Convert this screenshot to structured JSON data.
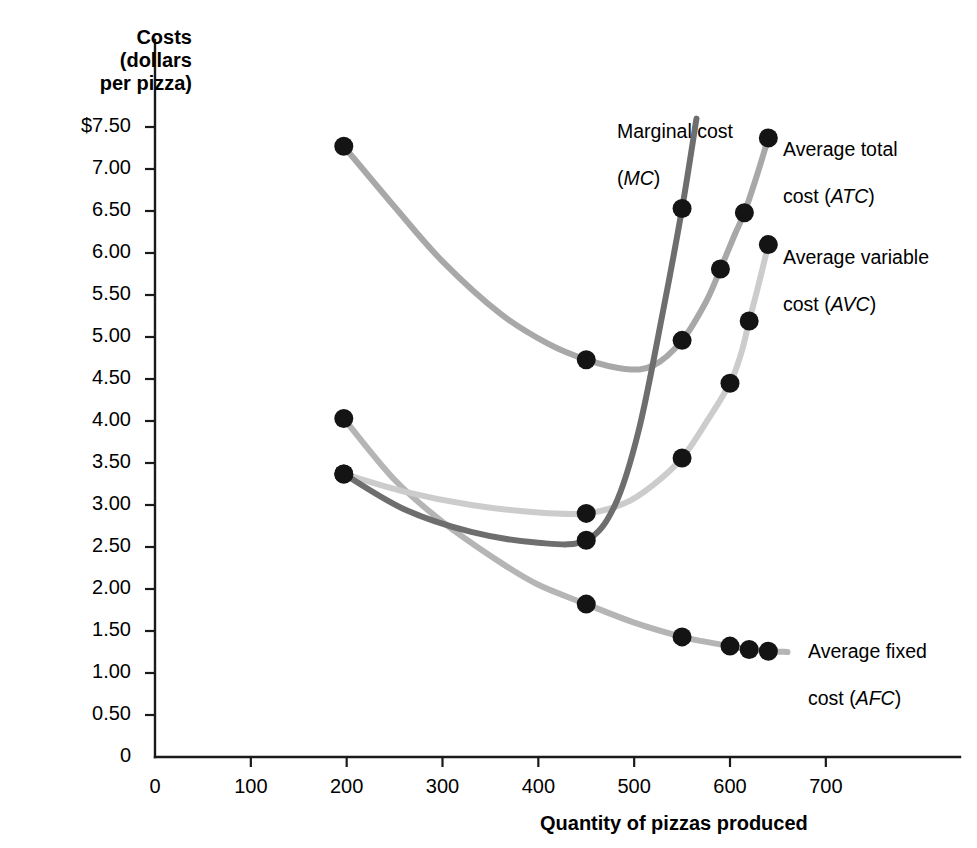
{
  "chart_data": {
    "type": "line",
    "title": "",
    "xlabel": "Quantity of pizzas produced",
    "ylabel": "Costs (dollars per pizza)",
    "xlim": [
      0,
      700
    ],
    "ylim": [
      0,
      7.75
    ],
    "grid": false,
    "legend_position": "inline-annotations",
    "x_ticks": [
      "0",
      "100",
      "200",
      "300",
      "400",
      "500",
      "600",
      "700"
    ],
    "x_tick_values": [
      0,
      100,
      200,
      300,
      400,
      500,
      600,
      700
    ],
    "y_ticks": [
      "0",
      "0.50",
      "1.00",
      "1.50",
      "2.00",
      "2.50",
      "3.00",
      "3.50",
      "4.00",
      "4.50",
      "5.00",
      "5.50",
      "6.00",
      "6.50",
      "7.00",
      "$7.50"
    ],
    "y_tick_values": [
      0,
      0.5,
      1.0,
      1.5,
      2.0,
      2.5,
      3.0,
      3.5,
      4.0,
      4.5,
      5.0,
      5.5,
      6.0,
      6.5,
      7.0,
      7.5
    ],
    "series": [
      {
        "name": "Marginal cost (MC)",
        "short": "MC",
        "color": "#6e6e6e",
        "points": [
          {
            "x": 197,
            "y": 3.37
          },
          {
            "x": 450,
            "y": 2.58
          },
          {
            "x": 550,
            "y": 6.53
          }
        ]
      },
      {
        "name": "Average total cost (ATC)",
        "short": "ATC",
        "color": "#a8a8a8",
        "points": [
          {
            "x": 197,
            "y": 7.27
          },
          {
            "x": 450,
            "y": 4.73
          },
          {
            "x": 550,
            "y": 4.96
          },
          {
            "x": 590,
            "y": 5.81
          },
          {
            "x": 615,
            "y": 6.48
          },
          {
            "x": 640,
            "y": 7.37
          }
        ]
      },
      {
        "name": "Average variable cost (AVC)",
        "short": "AVC",
        "color": "#cccccc",
        "points": [
          {
            "x": 197,
            "y": 3.37
          },
          {
            "x": 450,
            "y": 2.9
          },
          {
            "x": 550,
            "y": 3.56
          },
          {
            "x": 600,
            "y": 4.45
          },
          {
            "x": 620,
            "y": 5.19
          },
          {
            "x": 640,
            "y": 6.1
          }
        ]
      },
      {
        "name": "Average fixed cost (AFC)",
        "short": "AFC",
        "color": "#b5b5b5",
        "points": [
          {
            "x": 197,
            "y": 4.03
          },
          {
            "x": 450,
            "y": 1.82
          },
          {
            "x": 550,
            "y": 1.43
          },
          {
            "x": 600,
            "y": 1.32
          },
          {
            "x": 620,
            "y": 1.28
          },
          {
            "x": 640,
            "y": 1.26
          }
        ]
      }
    ],
    "annotations": [
      {
        "id": "mc",
        "text": "Marginal cost\n(MC)",
        "italic_part": "MC"
      },
      {
        "id": "atc",
        "text": "Average total\ncost (ATC)",
        "italic_part": "ATC"
      },
      {
        "id": "avc",
        "text": "Average variable\ncost (AVC)",
        "italic_part": "AVC"
      },
      {
        "id": "afc",
        "text": "Average fixed\ncost (AFC)",
        "italic_part": "AFC"
      }
    ]
  },
  "labels": {
    "y_axis_title": "Costs\n(dollars\nper pizza)",
    "x_axis_title": "Quantity of pizzas produced",
    "mc_line1": "Marginal cost",
    "mc_line2_open": "(",
    "mc_line2_italic": "MC",
    "mc_line2_close": ")",
    "atc_line1": "Average total",
    "atc_line2_pre": "cost (",
    "atc_line2_italic": "ATC",
    "atc_line2_close": ")",
    "avc_line1": "Average variable",
    "avc_line2_pre": "cost (",
    "avc_line2_italic": "AVC",
    "avc_line2_close": ")",
    "afc_line1": "Average fixed",
    "afc_line2_pre": "cost (",
    "afc_line2_italic": "AFC",
    "afc_line2_close": ")"
  },
  "colors": {
    "axis": "#1a1a1a",
    "mc": "#6e6e6e",
    "atc": "#a8a8a8",
    "avc": "#cccccc",
    "afc": "#b5b5b5",
    "point": "#141414",
    "background": "#ffffff"
  }
}
